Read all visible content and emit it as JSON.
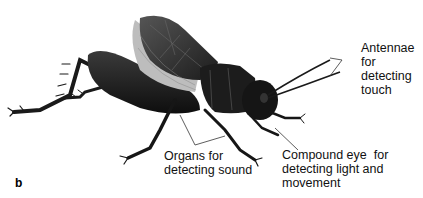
{
  "figure": {
    "panel_letter": "b",
    "labels": {
      "antennae": [
        "Antennae",
        "for",
        "detecting",
        "touch"
      ],
      "organs": [
        "Organs for",
        "detecting sound"
      ],
      "eye": [
        "Compound eye  for",
        "detecting light and",
        "movement"
      ]
    },
    "colors": {
      "body": "#1a1a1a",
      "wing": "#3a3a3a",
      "wing_light": "#b8b8b8",
      "leader_line": "#333333"
    }
  }
}
